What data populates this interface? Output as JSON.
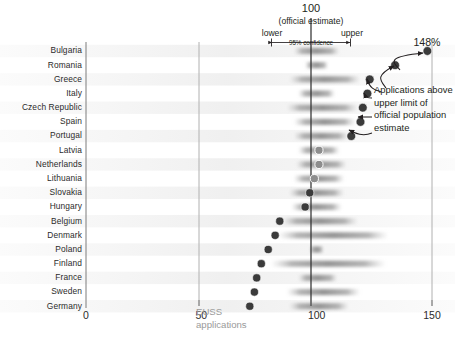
{
  "chart_data": {
    "type": "scatter",
    "title": "",
    "xlabel": "EUSS applications",
    "ylabel": "",
    "xlim": [
      0,
      150
    ],
    "xticks": [
      0,
      50,
      100,
      150
    ],
    "xticklabels": [
      "0",
      "50",
      "100",
      "150"
    ],
    "grid": false,
    "reference_line": 100,
    "categories": [
      "Bulgaria",
      "Romania",
      "Greece",
      "Italy",
      "Czech Republic",
      "Spain",
      "Portugal",
      "Latvia",
      "Netherlands",
      "Lithuania",
      "Slovakia",
      "Hungary",
      "Belgium",
      "Denmark",
      "Poland",
      "Finland",
      "France",
      "Sweden",
      "Germany"
    ],
    "series": [
      {
        "name": "EUSS applications (% of official population estimate)",
        "values": [
          148,
          134,
          123,
          122,
          120,
          119,
          115,
          101,
          101,
          99,
          97,
          95,
          84,
          82,
          79,
          76,
          74,
          73,
          71
        ]
      }
    ],
    "confidence_bands": [
      {
        "category": "Bulgaria",
        "lower": 90,
        "upper": 110
      },
      {
        "category": "Romania",
        "lower": 95,
        "upper": 105
      },
      {
        "category": "Greece",
        "lower": 88,
        "upper": 119
      },
      {
        "category": "Italy",
        "lower": 92,
        "upper": 108
      },
      {
        "category": "Czech Republic",
        "lower": 87,
        "upper": 118
      },
      {
        "category": "Spain",
        "lower": 90,
        "upper": 117
      },
      {
        "category": "Portugal",
        "lower": 90,
        "upper": 114
      },
      {
        "category": "Latvia",
        "lower": 92,
        "upper": 110
      },
      {
        "category": "Netherlands",
        "lower": 91,
        "upper": 113
      },
      {
        "category": "Lithuania",
        "lower": 90,
        "upper": 112
      },
      {
        "category": "Slovakia",
        "lower": 88,
        "upper": 112
      },
      {
        "category": "Hungary",
        "lower": 89,
        "upper": 111
      },
      {
        "category": "Belgium",
        "lower": 85,
        "upper": 118
      },
      {
        "category": "Denmark",
        "lower": 83,
        "upper": 131
      },
      {
        "category": "Poland",
        "lower": 97,
        "upper": 103
      },
      {
        "category": "Finland",
        "lower": 80,
        "upper": 130
      },
      {
        "category": "France",
        "lower": 92,
        "upper": 109
      },
      {
        "category": "Sweden",
        "lower": 87,
        "upper": 119
      },
      {
        "category": "Germany",
        "lower": 88,
        "upper": 114
      }
    ],
    "highlighted_points": [
      "Bulgaria",
      "Romania",
      "Greece",
      "Italy",
      "Czech Republic",
      "Spain",
      "Portugal"
    ],
    "max_label": "148%",
    "annotations": [
      {
        "name": "upper-limit-note",
        "text": "Applications above upper limit of official population estimate"
      }
    ]
  },
  "header": {
    "center_value": "100",
    "official_estimate": "(official estimate)",
    "lower_label": "lower",
    "upper_label": "upper",
    "confidence_label": "95% confidence",
    "max_value_label": "148%"
  },
  "axis": {
    "x_label_line1": "EUSS",
    "x_label_line2": "applications",
    "ticks": [
      "0",
      "50",
      "100",
      "150"
    ]
  },
  "annotation": {
    "text": "Applications above upper limit of official population estimate"
  },
  "colors": {
    "dot_dark": "#3b3b3b",
    "dot_light": "#8d8d8d",
    "band": "#b9b9b9",
    "axis": "#7c7c7c",
    "reference_line": "#2a2a2a",
    "euss_text": "#9a9a9a",
    "text": "#231f20"
  }
}
